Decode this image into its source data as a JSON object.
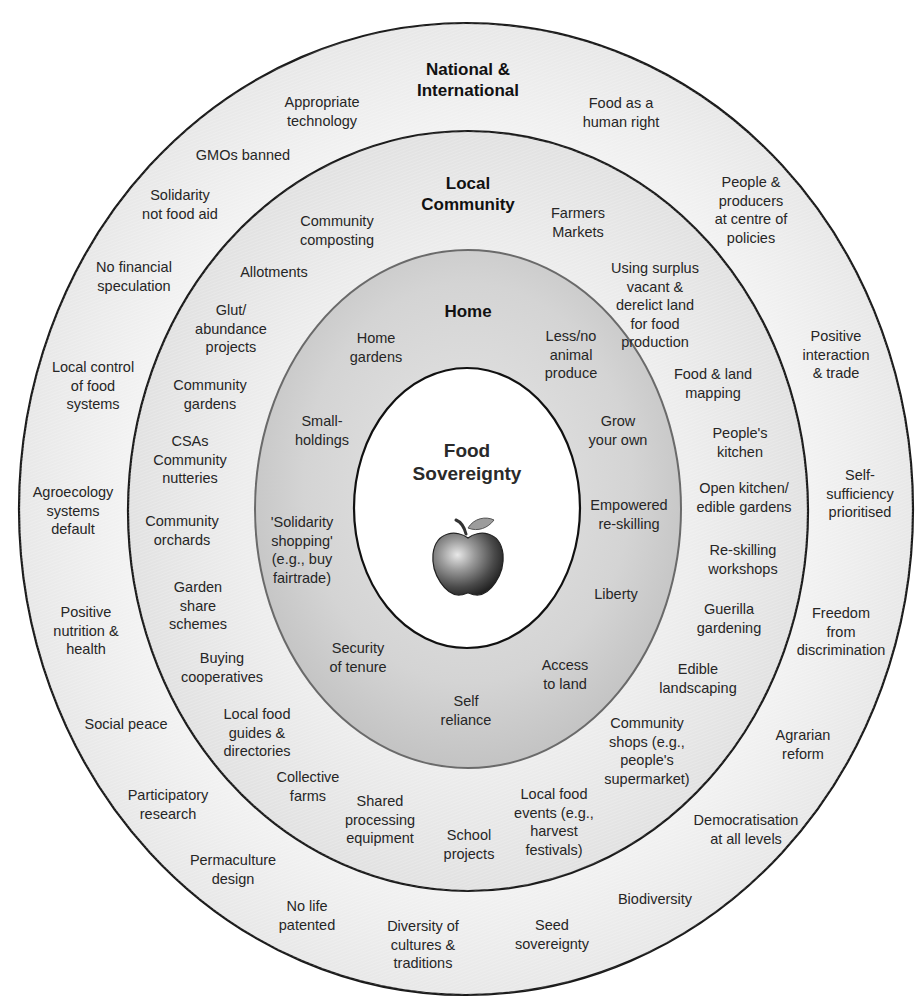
{
  "colors": {
    "background": "#ffffff",
    "outer_ring_fill": "#ececec",
    "community_ring_fill": "#e4e4e4",
    "home_ring_fill": "#cfcfcf",
    "center_fill": "#ffffff",
    "stroke": "#1a1a1a",
    "text": "#262626"
  },
  "center": {
    "title": "Food\nSovereignty",
    "icon": "apple-icon"
  },
  "rings": {
    "home": {
      "title": "Home",
      "items": [
        {
          "text": "Home\ngardens",
          "x": 376,
          "y": 347
        },
        {
          "text": "Less/no\nanimal\nproduce",
          "x": 571,
          "y": 355
        },
        {
          "text": "Small-\nholdings",
          "x": 322,
          "y": 430
        },
        {
          "text": "Grow\nyour own",
          "x": 618,
          "y": 430
        },
        {
          "text": "Empowered\nre-skilling",
          "x": 629,
          "y": 514
        },
        {
          "text": "'Solidarity\nshopping'\n(e.g., buy\nfairtrade)",
          "x": 302,
          "y": 550
        },
        {
          "text": "Liberty",
          "x": 616,
          "y": 594
        },
        {
          "text": "Security\nof tenure",
          "x": 358,
          "y": 657
        },
        {
          "text": "Access\nto land",
          "x": 565,
          "y": 674
        },
        {
          "text": "Self\nreliance",
          "x": 466,
          "y": 710
        }
      ]
    },
    "local_community": {
      "title": "Local\nCommunity",
      "items": [
        {
          "text": "Community\ncomposting",
          "x": 337,
          "y": 230
        },
        {
          "text": "Farmers\nMarkets",
          "x": 578,
          "y": 222
        },
        {
          "text": "Allotments",
          "x": 274,
          "y": 272
        },
        {
          "text": "Using surplus\nvacant &\nderelict land\nfor food\nproduction",
          "x": 655,
          "y": 305
        },
        {
          "text": "Glut/\nabundance\nprojects",
          "x": 231,
          "y": 329
        },
        {
          "text": "Food & land\nmapping",
          "x": 713,
          "y": 383
        },
        {
          "text": "Community\ngardens",
          "x": 210,
          "y": 394
        },
        {
          "text": "People's\nkitchen",
          "x": 740,
          "y": 442
        },
        {
          "text": "CSAs\nCommunity\nnutteries",
          "x": 190,
          "y": 460
        },
        {
          "text": "Open kitchen/\nedible gardens",
          "x": 744,
          "y": 497
        },
        {
          "text": "Community\norchards",
          "x": 182,
          "y": 530
        },
        {
          "text": "Re-skilling\nworkshops",
          "x": 743,
          "y": 559
        },
        {
          "text": "Garden\nshare\nschemes",
          "x": 198,
          "y": 606
        },
        {
          "text": "Guerilla\ngardening",
          "x": 729,
          "y": 618
        },
        {
          "text": "Buying\ncooperatives",
          "x": 222,
          "y": 667
        },
        {
          "text": "Edible\nlandscaping",
          "x": 698,
          "y": 678
        },
        {
          "text": "Local food\nguides &\ndirectories",
          "x": 257,
          "y": 733
        },
        {
          "text": "Community\nshops (e.g.,\npeople's\nsupermarket)",
          "x": 647,
          "y": 751
        },
        {
          "text": "Collective\nfarms",
          "x": 308,
          "y": 786
        },
        {
          "text": "Local food\nevents (e.g.,\nharvest\nfestivals)",
          "x": 554,
          "y": 822
        },
        {
          "text": "Shared\nprocessing\nequipment",
          "x": 380,
          "y": 820
        },
        {
          "text": "School\nprojects",
          "x": 469,
          "y": 844
        }
      ]
    },
    "national_international": {
      "title": "National &\nInternational",
      "items": [
        {
          "text": "Appropriate\ntechnology",
          "x": 322,
          "y": 111
        },
        {
          "text": "Food as a\nhuman right",
          "x": 621,
          "y": 112
        },
        {
          "text": "GMOs banned",
          "x": 243,
          "y": 155
        },
        {
          "text": "Solidarity\nnot food aid",
          "x": 180,
          "y": 204
        },
        {
          "text": "People &\nproducers\nat centre of\npolicies",
          "x": 751,
          "y": 210
        },
        {
          "text": "No financial\nspeculation",
          "x": 134,
          "y": 276
        },
        {
          "text": "Positive\ninteraction\n& trade",
          "x": 836,
          "y": 355
        },
        {
          "text": "Local control\nof food\nsystems",
          "x": 93,
          "y": 386
        },
        {
          "text": "Agroecology\nsystems\ndefault",
          "x": 73,
          "y": 511
        },
        {
          "text": "Self-\nsufficiency\nprioritised",
          "x": 860,
          "y": 494
        },
        {
          "text": "Positive\nnutrition &\nhealth",
          "x": 86,
          "y": 631
        },
        {
          "text": "Freedom\nfrom\ndiscrimination",
          "x": 841,
          "y": 632
        },
        {
          "text": "Social peace",
          "x": 126,
          "y": 724
        },
        {
          "text": "Agrarian\nreform",
          "x": 803,
          "y": 744
        },
        {
          "text": "Participatory\nresearch",
          "x": 168,
          "y": 804
        },
        {
          "text": "Democratisation\nat all levels",
          "x": 746,
          "y": 829
        },
        {
          "text": "Permaculture\ndesign",
          "x": 233,
          "y": 869
        },
        {
          "text": "Biodiversity",
          "x": 655,
          "y": 899
        },
        {
          "text": "No life\npatented",
          "x": 307,
          "y": 915
        },
        {
          "text": "Seed\nsovereignty",
          "x": 552,
          "y": 934
        },
        {
          "text": "Diversity of\ncultures &\ntraditions",
          "x": 423,
          "y": 945
        }
      ]
    }
  }
}
